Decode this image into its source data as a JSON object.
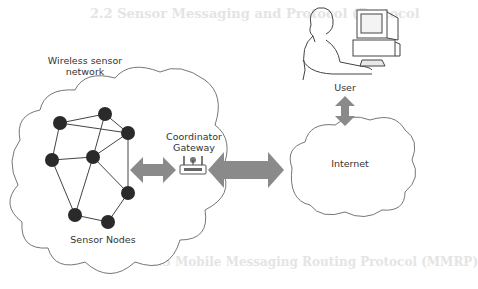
{
  "diagram": {
    "labels": {
      "wsn": "Wireless sensor network",
      "wsn_line1": "Wireless sensor",
      "wsn_line2": "network",
      "sensor_nodes": "Sensor Nodes",
      "coordinator_line1": "Coordinator",
      "coordinator_line2": "Gateway",
      "internet": "Internet",
      "user": "User"
    },
    "icons": [
      "sensor-node-icon",
      "router-icon",
      "user-at-computer-icon",
      "double-arrow-icon",
      "cloud-icon"
    ],
    "colors": {
      "arrow": "#8a8a8a",
      "node": "#2a2a2a",
      "outline": "#666666",
      "ghost_text": "#e4e4e4"
    },
    "background_text": {
      "heading1": "2.2 Sensor Messaging and Protocol (Protocol",
      "heading2": "2.3 Mobile Messaging Routing Protocol (MMRP)"
    }
  }
}
